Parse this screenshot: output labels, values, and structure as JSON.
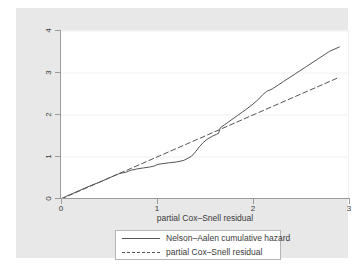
{
  "chart_data": {
    "type": "line",
    "title": "",
    "xlabel": "partial Cox–Snell residual",
    "ylabel": "",
    "xlim": [
      0,
      3
    ],
    "ylim": [
      0,
      4
    ],
    "xticks": [
      "0",
      "1",
      "2",
      "3"
    ],
    "xtick_values": [
      0,
      1,
      2,
      3
    ],
    "yticks": [
      "0",
      "1",
      "2",
      "3",
      "4"
    ],
    "ytick_values": [
      0,
      1,
      2,
      3,
      4
    ],
    "grid": "horizontal",
    "legend_position": "below-axes",
    "series": [
      {
        "name": "Nelson–Aalen cumulative hazard",
        "style": "solid",
        "color": "#555555",
        "x": [
          0.0,
          0.05,
          0.12,
          0.2,
          0.3,
          0.4,
          0.5,
          0.55,
          0.58,
          0.6,
          0.64,
          0.68,
          0.7,
          0.72,
          0.76,
          0.8,
          0.86,
          0.92,
          0.96,
          0.98,
          1.0,
          1.05,
          1.12,
          1.2,
          1.28,
          1.33,
          1.36,
          1.4,
          1.44,
          1.48,
          1.52,
          1.58,
          1.62,
          1.64,
          1.66,
          1.7,
          1.76,
          1.84,
          1.92,
          2.0,
          2.06,
          2.1,
          2.14,
          2.2,
          2.32,
          2.44,
          2.56,
          2.68,
          2.8,
          2.9
        ],
        "y": [
          0.0,
          0.06,
          0.13,
          0.21,
          0.31,
          0.4,
          0.5,
          0.55,
          0.58,
          0.6,
          0.62,
          0.64,
          0.66,
          0.68,
          0.7,
          0.72,
          0.74,
          0.76,
          0.78,
          0.79,
          0.82,
          0.84,
          0.86,
          0.88,
          0.92,
          0.98,
          1.02,
          1.12,
          1.24,
          1.34,
          1.42,
          1.5,
          1.54,
          1.56,
          1.7,
          1.76,
          1.86,
          1.99,
          2.12,
          2.26,
          2.38,
          2.48,
          2.56,
          2.62,
          2.8,
          2.98,
          3.16,
          3.34,
          3.52,
          3.62
        ]
      },
      {
        "name": "partial Cox–Snell residual",
        "style": "dashed",
        "color": "#555555",
        "x": [
          0.0,
          2.9
        ],
        "y": [
          0.0,
          2.9
        ]
      }
    ]
  },
  "axis": {
    "x_title": "partial Cox–Snell residual"
  },
  "legend": {
    "entries": [
      {
        "label": "Nelson–Aalen cumulative hazard",
        "style": "solid"
      },
      {
        "label": "partial Cox–Snell residual",
        "style": "dashed"
      }
    ]
  }
}
